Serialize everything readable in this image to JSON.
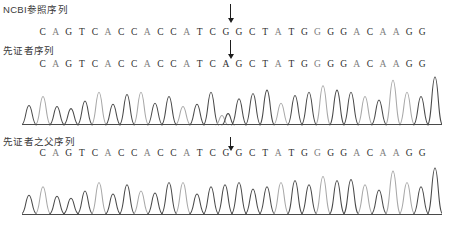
{
  "figure": {
    "type": "sanger-sequencing-chromatogram"
  },
  "rows": [
    {
      "label": "NCBI参照序列",
      "sequence": "CAGTCACCACCATCGGCTATGGGGACAAGG",
      "has_trace": false,
      "has_arrow": true,
      "arrow_index": 14,
      "arrow_style": "long"
    },
    {
      "label": "先证者序列",
      "sequence": "CAGTCACCACCATCAGCTATGGGGACAAGG",
      "has_trace": true,
      "has_arrow": true,
      "arrow_index": 14,
      "arrow_style": "long"
    },
    {
      "label": "先证者之父序列",
      "sequence": "CAGTCACCACCATCGGCTATGGGGACAAGG",
      "has_trace": true,
      "has_arrow": true,
      "arrow_index": 14,
      "arrow_style": "short"
    }
  ],
  "mutation": {
    "reference_base": "G",
    "variant_base": "A",
    "position_index": 14,
    "marker": "down-arrow"
  },
  "colors": {
    "text": "#3a3a3a",
    "sequence": "#5a5a5a",
    "sequence_dark": "#2d2d2d",
    "sequence_light": "#7d7d7d",
    "arrow": "#1d1d1d",
    "trace_dark": "#4a4a4a",
    "trace_light": "#a8a8a8",
    "baseline": "#4a4a4a",
    "background": "#ffffff"
  },
  "chart_data": {
    "type": "line",
    "title": "",
    "xlabel": "",
    "ylabel": "",
    "grid": false,
    "legend": "none",
    "traces": [
      {
        "name": "proband-trace",
        "bases": [
          "C",
          "A",
          "G",
          "T",
          "C",
          "A",
          "C",
          "C",
          "A",
          "C",
          "C",
          "A",
          "T",
          "C",
          "A/G",
          "G",
          "C",
          "T",
          "A",
          "T",
          "G",
          "G",
          "G",
          "G",
          "A",
          "C",
          "A",
          "A",
          "G",
          "G"
        ],
        "peak_heights": [
          18,
          26,
          17,
          15,
          22,
          30,
          19,
          28,
          30,
          20,
          26,
          17,
          19,
          30,
          11,
          24,
          29,
          32,
          20,
          27,
          30,
          36,
          32,
          30,
          26,
          23,
          41,
          30,
          26,
          44
        ],
        "peak_shades": [
          "dark",
          "light",
          "dark",
          "dark",
          "dark",
          "light",
          "dark",
          "dark",
          "light",
          "dark",
          "dark",
          "light",
          "dark",
          "dark",
          "mixed",
          "dark",
          "dark",
          "dark",
          "light",
          "dark",
          "dark",
          "light",
          "dark",
          "dark",
          "light",
          "dark",
          "light",
          "light",
          "dark",
          "dark"
        ],
        "baseline": true
      },
      {
        "name": "father-trace",
        "bases": [
          "C",
          "A",
          "G",
          "T",
          "C",
          "A",
          "C",
          "C",
          "A",
          "C",
          "C",
          "A",
          "T",
          "C",
          "G",
          "G",
          "C",
          "T",
          "A",
          "T",
          "G",
          "G",
          "G",
          "G",
          "A",
          "C",
          "A",
          "A",
          "G",
          "G"
        ],
        "peak_heights": [
          18,
          26,
          17,
          15,
          22,
          30,
          19,
          28,
          22,
          20,
          30,
          30,
          19,
          26,
          28,
          30,
          24,
          26,
          30,
          32,
          28,
          36,
          32,
          33,
          28,
          23,
          41,
          30,
          26,
          44
        ],
        "peak_shades": [
          "dark",
          "light",
          "dark",
          "dark",
          "dark",
          "light",
          "dark",
          "dark",
          "light",
          "dark",
          "dark",
          "light",
          "dark",
          "dark",
          "dark",
          "dark",
          "dark",
          "dark",
          "light",
          "dark",
          "dark",
          "light",
          "dark",
          "dark",
          "light",
          "dark",
          "light",
          "light",
          "dark",
          "dark"
        ],
        "baseline": true
      }
    ]
  }
}
